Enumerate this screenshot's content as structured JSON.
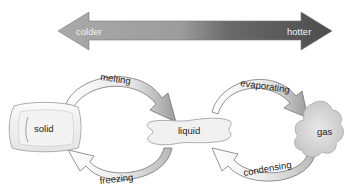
{
  "temperature_scale": {
    "left_label": "colder",
    "right_label": "hotter",
    "gradient_colors": [
      "#a8a8a8",
      "#9a9a9a",
      "#5e5e5e",
      "#4a4a4a"
    ]
  },
  "states": {
    "solid": {
      "label": "solid",
      "icon": "ice-cube-icon"
    },
    "liquid": {
      "label": "liquid",
      "icon": "puddle-icon"
    },
    "gas": {
      "label": "gas",
      "icon": "cloud-icon"
    }
  },
  "transitions": {
    "melting": {
      "label": "melting",
      "from": "solid",
      "to": "liquid"
    },
    "freezing": {
      "label": "freezing",
      "from": "liquid",
      "to": "solid"
    },
    "evaporating": {
      "label": "evaporating",
      "from": "liquid",
      "to": "gas"
    },
    "condensing": {
      "label": "condensing",
      "from": "gas",
      "to": "liquid"
    }
  }
}
